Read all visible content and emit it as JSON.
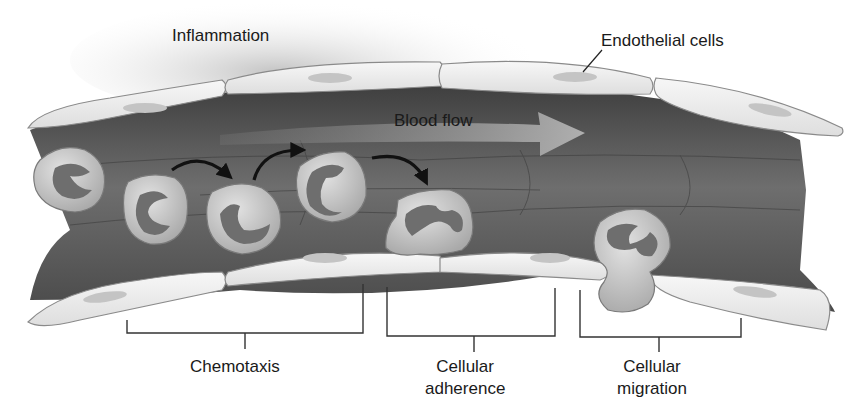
{
  "labels": {
    "inflammation": "Inflammation",
    "endothelial_cells": "Endothelial cells",
    "blood_flow": "Blood flow",
    "chemotaxis": "Chemotaxis",
    "cellular_adherence_line1": "Cellular",
    "cellular_adherence_line2": "adherence",
    "cellular_migration_line1": "Cellular",
    "cellular_migration_line2": "migration"
  },
  "stages": [
    {
      "name": "Chemotaxis"
    },
    {
      "name": "Cellular adherence"
    },
    {
      "name": "Cellular migration"
    }
  ],
  "colors": {
    "vessel_dark": "#5a5a5a",
    "vessel_mid": "#7a7a7a",
    "endothelial_fill": "#ececec",
    "endothelial_nucleus": "#c4c4c4",
    "leukocyte_fill": "#cfcfcf",
    "leukocyte_nucleus": "#6e6e6e",
    "arrow": "#111111",
    "blood_flow_arrow": "#a8a8a8",
    "inflammation_haze": "#d8d8d8"
  }
}
